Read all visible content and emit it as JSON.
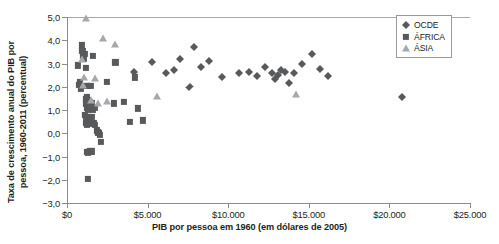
{
  "chart_data": {
    "type": "scatter",
    "title": "",
    "xlabel": "PIB por pessoa em 1960 (em dólares de 2005)",
    "ylabel_line1": "Taxa de crescimento anual do PIB por",
    "ylabel_line2": "pessoa, 1960-2011 (percentual)",
    "xlim": [
      0,
      25000
    ],
    "ylim": [
      -3.0,
      5.0
    ],
    "grid": false,
    "zero_line": true,
    "legend_position": "top-right",
    "xticks": [
      0,
      5000,
      10000,
      15000,
      20000,
      25000
    ],
    "xticklabels": [
      "$0",
      "$5.000",
      "$10.000",
      "$15.000",
      "$20.000",
      "$25.000"
    ],
    "yticks": [
      -3.0,
      -2.0,
      -1.0,
      0.0,
      1.0,
      2.0,
      3.0,
      4.0,
      5.0
    ],
    "yticklabels": [
      "−3,0",
      "−2,0",
      "−1,0",
      "0,0",
      "1,0",
      "2,0",
      "3,0",
      "4,0",
      "5,0"
    ],
    "series": [
      {
        "name": "OCDE",
        "marker": "diamond",
        "color": "#58595b",
        "points": [
          [
            5250,
            3.05
          ],
          [
            6150,
            2.58
          ],
          [
            6650,
            2.7
          ],
          [
            7000,
            3.18
          ],
          [
            7600,
            1.98
          ],
          [
            7900,
            3.7
          ],
          [
            8300,
            2.85
          ],
          [
            8800,
            3.1
          ],
          [
            9600,
            2.41
          ],
          [
            10700,
            2.6
          ],
          [
            11300,
            2.62
          ],
          [
            11800,
            2.47
          ],
          [
            12300,
            2.85
          ],
          [
            12700,
            2.6
          ],
          [
            13100,
            2.52
          ],
          [
            13500,
            2.64
          ],
          [
            13800,
            2.17
          ],
          [
            14100,
            2.6
          ],
          [
            14600,
            2.96
          ],
          [
            15200,
            3.42
          ],
          [
            15700,
            2.76
          ],
          [
            16200,
            2.45
          ],
          [
            20800,
            1.55
          ],
          [
            4150,
            2.62
          ],
          [
            13300,
            2.72
          ],
          [
            12900,
            2.33
          ]
        ]
      },
      {
        "name": "ÁFRICA",
        "marker": "square",
        "color": "#58595b",
        "points": [
          [
            700,
            2.92
          ],
          [
            750,
            2.08
          ],
          [
            800,
            2.22
          ],
          [
            850,
            1.93
          ],
          [
            900,
            3.78
          ],
          [
            950,
            3.55
          ],
          [
            1000,
            3.32
          ],
          [
            1050,
            3.2
          ],
          [
            1100,
            3.4
          ],
          [
            1150,
            2.82
          ],
          [
            1200,
            2.05
          ],
          [
            1300,
            2.02
          ],
          [
            1450,
            2.02
          ],
          [
            1600,
            3.32
          ],
          [
            1250,
            1.55
          ],
          [
            1300,
            1.42
          ],
          [
            1350,
            1.3
          ],
          [
            1380,
            1.2
          ],
          [
            1420,
            1.36
          ],
          [
            1150,
            1.48
          ],
          [
            1200,
            1.28
          ],
          [
            1250,
            1.08
          ],
          [
            1320,
            1.02
          ],
          [
            1400,
            1.12
          ],
          [
            1500,
            1.18
          ],
          [
            1550,
            1.28
          ],
          [
            1600,
            1.02
          ],
          [
            1700,
            1.1
          ],
          [
            1100,
            0.8
          ],
          [
            1200,
            0.72
          ],
          [
            1300,
            0.62
          ],
          [
            1400,
            0.68
          ],
          [
            1480,
            0.6
          ],
          [
            1550,
            0.7
          ],
          [
            1150,
            0.45
          ],
          [
            1250,
            0.38
          ],
          [
            1350,
            0.42
          ],
          [
            1650,
            0.45
          ],
          [
            1750,
            0.35
          ],
          [
            1850,
            0.12
          ],
          [
            1900,
            0.05
          ],
          [
            1950,
            0.02
          ],
          [
            2000,
            0.0
          ],
          [
            2050,
            -0.08
          ],
          [
            2080,
            -0.38
          ],
          [
            1250,
            -0.8
          ],
          [
            1320,
            -0.82
          ],
          [
            1450,
            -0.78
          ],
          [
            1550,
            -0.78
          ],
          [
            1300,
            -1.97
          ],
          [
            3000,
            3.05
          ],
          [
            3900,
            0.48
          ],
          [
            4400,
            1.07
          ],
          [
            3550,
            1.35
          ],
          [
            4200,
            2.4
          ],
          [
            2500,
            2.2
          ],
          [
            2900,
            1.28
          ],
          [
            4700,
            0.55
          ]
        ]
      },
      {
        "name": "ÁSIA",
        "marker": "triangle",
        "color": "#a6a8ab",
        "points": [
          [
            1150,
            4.95
          ],
          [
            2250,
            4.1
          ],
          [
            2950,
            3.85
          ],
          [
            1050,
            2.42
          ],
          [
            1750,
            2.38
          ],
          [
            1500,
            1.42
          ],
          [
            2500,
            1.4
          ],
          [
            1950,
            1.28
          ],
          [
            5600,
            1.62
          ],
          [
            14200,
            1.7
          ],
          [
            900,
            3.18
          ],
          [
            1020,
            2.08
          ]
        ]
      }
    ]
  },
  "legend": {
    "items": [
      {
        "label": "OCDE",
        "marker": "diamond"
      },
      {
        "label": "ÁFRICA",
        "marker": "square"
      },
      {
        "label": "ÁSIA",
        "marker": "triangle"
      }
    ]
  }
}
